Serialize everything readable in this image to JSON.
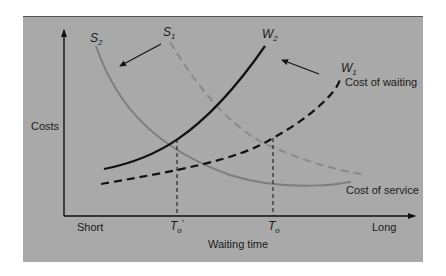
{
  "diagram": {
    "y_axis_label": "Costs",
    "x_axis_label": "Waiting time",
    "x_tick_short": "Short",
    "x_tick_long": "Long",
    "t_prime_label": "T",
    "t_prime_sub": "o",
    "t_prime_mark": "′",
    "t_label": "T",
    "t_sub": "o",
    "curves": {
      "s1": {
        "label": "S",
        "sub": "1",
        "style": "dashed gray"
      },
      "s2": {
        "label": "S",
        "sub": "2",
        "style": "solid gray"
      },
      "w1": {
        "label": "W",
        "sub": "1",
        "style": "dashed black"
      },
      "w2": {
        "label": "W",
        "sub": "2",
        "style": "solid black"
      }
    },
    "cost_of_waiting_label": "Cost of waiting",
    "cost_of_service_label": "Cost of service",
    "colors": {
      "panel": "#a9a9a9",
      "panel_border": "#555555",
      "waiting_curve": "#111111",
      "service_curve": "#7e7e7e",
      "axis": "#111111"
    }
  }
}
